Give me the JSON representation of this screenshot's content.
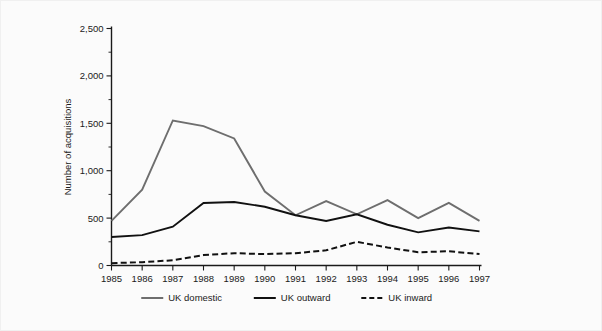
{
  "chart_data": {
    "type": "line",
    "title": "",
    "xlabel": "",
    "ylabel": "Number of acquisitions",
    "categories": [
      "1985",
      "1986",
      "1987",
      "1988",
      "1989",
      "1990",
      "1991",
      "1992",
      "1993",
      "1994",
      "1995",
      "1996",
      "1997"
    ],
    "xlim": [
      1985,
      1997
    ],
    "ylim": [
      0,
      2500
    ],
    "yticks": [
      0,
      500,
      1000,
      1500,
      2000,
      2500
    ],
    "ytick_labels": [
      "0",
      "500",
      "1,000",
      "1,500",
      "2,000",
      "2,500"
    ],
    "yminor_interval": 250,
    "grid": false,
    "legend_position": "bottom-center",
    "series": [
      {
        "name": "UK domestic",
        "color": "#6e6e6e",
        "style": "solid",
        "values": [
          470,
          800,
          1530,
          1470,
          1340,
          780,
          530,
          680,
          540,
          690,
          500,
          660,
          470
        ]
      },
      {
        "name": "UK outward",
        "color": "#111111",
        "style": "solid",
        "values": [
          300,
          320,
          410,
          660,
          670,
          620,
          530,
          470,
          540,
          430,
          350,
          400,
          360
        ]
      },
      {
        "name": "UK inward",
        "color": "#111111",
        "style": "dashed",
        "values": [
          25,
          35,
          55,
          110,
          130,
          120,
          130,
          160,
          250,
          190,
          140,
          150,
          120
        ]
      }
    ]
  },
  "axis": {
    "ylabel": "Number of acquisitions"
  },
  "legend": {
    "items": [
      {
        "label": "UK domestic"
      },
      {
        "label": "UK outward"
      },
      {
        "label": "UK inward"
      }
    ]
  }
}
